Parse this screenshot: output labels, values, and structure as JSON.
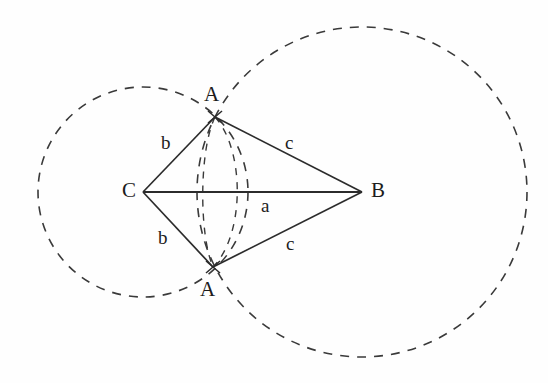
{
  "figure": {
    "background_color": "#fefefe",
    "stroke_color": "#2b2b2b",
    "dash_color": "#3a3a3a"
  },
  "points": [
    {
      "id": "A-top",
      "label": "A",
      "x": 215,
      "y": 117,
      "label_x": 204,
      "label_y": 84,
      "marker": "cross"
    },
    {
      "id": "A-bottom",
      "label": "A",
      "x": 213,
      "y": 267,
      "label_x": 200,
      "label_y": 279,
      "marker": "cross"
    },
    {
      "id": "B",
      "label": "B",
      "x": 362,
      "y": 192,
      "label_x": 371,
      "label_y": 180,
      "marker": "none"
    },
    {
      "id": "C",
      "label": "C",
      "x": 143,
      "y": 192,
      "label_x": 122,
      "label_y": 180,
      "marker": "none"
    }
  ],
  "segments": [
    {
      "id": "C-to-Atop",
      "from": "C",
      "to": "A-top",
      "label": "b",
      "label_x": 161,
      "label_y": 133
    },
    {
      "id": "Atop-to-B",
      "from": "A-top",
      "to": "B",
      "label": "c",
      "label_x": 285,
      "label_y": 133
    },
    {
      "id": "C-to-Abottom",
      "from": "C",
      "to": "A-bottom",
      "label": "b",
      "label_x": 158,
      "label_y": 228
    },
    {
      "id": "Abottom-to-B",
      "from": "A-bottom",
      "to": "B",
      "label": "c",
      "label_x": 286,
      "label_y": 234
    },
    {
      "id": "C-to-B",
      "from": "C",
      "to": "B",
      "label": "a",
      "label_x": 261,
      "label_y": 196
    }
  ],
  "circles": [
    {
      "id": "circle-around-C",
      "center": "C",
      "cx": 143,
      "cy": 192,
      "radius": 105,
      "style": "dashed",
      "radius_side": "b"
    },
    {
      "id": "circle-around-B",
      "center": "B",
      "cx": 362,
      "cy": 192,
      "radius": 165,
      "style": "dashed",
      "radius_side": "c"
    }
  ],
  "arcs": [
    {
      "id": "inner-arc-left",
      "description": "short dashed arc of circle C through both A points",
      "style": "dashed"
    },
    {
      "id": "inner-arc-right",
      "description": "short dashed arc of circle B through both A points",
      "style": "dashed"
    }
  ],
  "labels": {
    "vertex_a_top": "A",
    "vertex_a_bottom": "A",
    "vertex_b": "B",
    "vertex_c": "C",
    "side_b_upper": "b",
    "side_b_lower": "b",
    "side_c_upper": "c",
    "side_c_lower": "c",
    "side_a": "a"
  }
}
